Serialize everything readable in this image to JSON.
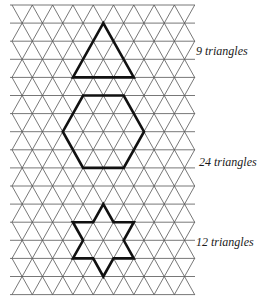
{
  "figure": {
    "background": "#ffffff",
    "grid_color": "#555555",
    "shape_color": "#111111",
    "grid": {
      "rows": 17,
      "row_y0": 5,
      "row_step": 18.1,
      "even_x0": 12,
      "odd_x0": 22.15,
      "col_step": 20.3,
      "x_min": 10,
      "x_max": 195
    },
    "shapes": [
      {
        "name": "triangle",
        "label": "9 triangles",
        "points": [
          [
            1,
            "odd",
            4
          ],
          [
            4,
            "even",
            6
          ],
          [
            4,
            "even",
            3
          ]
        ]
      },
      {
        "name": "hexagon",
        "label": "24 triangles",
        "points": [
          [
            5,
            "odd",
            3
          ],
          [
            5,
            "odd",
            5
          ],
          [
            7,
            "odd",
            6
          ],
          [
            9,
            "odd",
            5
          ],
          [
            9,
            "odd",
            3
          ],
          [
            7,
            "odd",
            2
          ]
        ]
      },
      {
        "name": "star",
        "label": "12 triangles",
        "points": [
          [
            11,
            "odd",
            4
          ],
          [
            12,
            "even",
            5
          ],
          [
            12,
            "even",
            6
          ],
          [
            13,
            "odd",
            5
          ],
          [
            14,
            "even",
            6
          ],
          [
            14,
            "even",
            5
          ],
          [
            15,
            "odd",
            4
          ],
          [
            14,
            "even",
            4
          ],
          [
            14,
            "even",
            3
          ],
          [
            13,
            "odd",
            3
          ],
          [
            12,
            "even",
            3
          ],
          [
            12,
            "even",
            4
          ]
        ]
      }
    ],
    "labels": [
      {
        "text": "9 triangles",
        "x": 196,
        "y": 45
      },
      {
        "text": "24 triangles",
        "x": 199,
        "y": 156
      },
      {
        "text": "12 triangles",
        "x": 196,
        "y": 236
      }
    ]
  }
}
